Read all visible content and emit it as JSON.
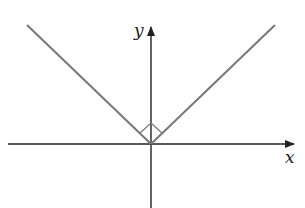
{
  "diagram": {
    "type": "graph-of-absolute-value",
    "axes": {
      "x_label": "x",
      "y_label": "y"
    },
    "right_angle_marker": true,
    "colors": {
      "axis": "#222222",
      "curve": "#777777",
      "marker": "#777777",
      "background": "#ffffff"
    }
  }
}
